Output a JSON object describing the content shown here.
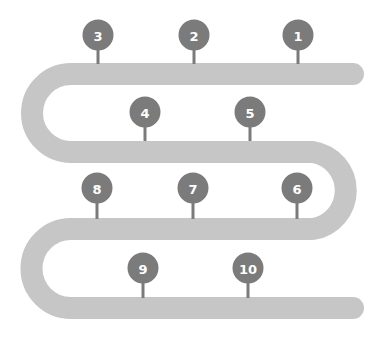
{
  "diagram": {
    "type": "serpentine-timeline",
    "colors": {
      "background": "#ffffff",
      "track": "#c6c6c6",
      "marker": "#7b7b7b",
      "stem": "#7b7b7b",
      "label": "#ffffff"
    },
    "markers": [
      {
        "label": "1",
        "cx": 298,
        "cy": 35,
        "stemY": 64
      },
      {
        "label": "2",
        "cx": 194,
        "cy": 35,
        "stemY": 64
      },
      {
        "label": "3",
        "cx": 98,
        "cy": 35,
        "stemY": 64
      },
      {
        "label": "4",
        "cx": 145,
        "cy": 112,
        "stemY": 141
      },
      {
        "label": "5",
        "cx": 250,
        "cy": 112,
        "stemY": 141
      },
      {
        "label": "6",
        "cx": 297,
        "cy": 188,
        "stemY": 219
      },
      {
        "label": "7",
        "cx": 193,
        "cy": 188,
        "stemY": 219
      },
      {
        "label": "8",
        "cx": 97,
        "cy": 188,
        "stemY": 219
      },
      {
        "label": "9",
        "cx": 143,
        "cy": 268,
        "stemY": 298
      },
      {
        "label": "10",
        "cx": 248,
        "cy": 268,
        "stemY": 298
      }
    ]
  }
}
